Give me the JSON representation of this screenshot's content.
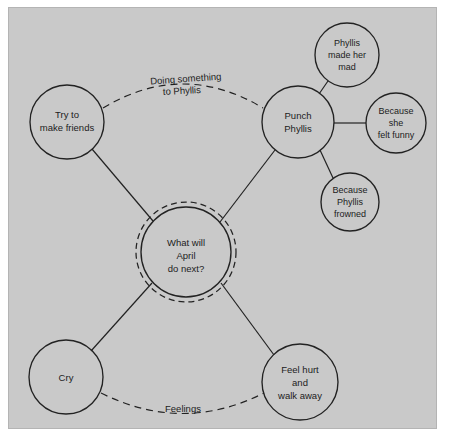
{
  "diagram": {
    "background_color": "#c9c9c9",
    "frame_color": "#b4b4b4",
    "stroke_color": "#222222",
    "text_color": "#1c1c1c",
    "central_node": {
      "id": "center",
      "lines": [
        "What will",
        "April",
        "do next?"
      ],
      "line1": "What will",
      "line2": "April",
      "line3": "do next?",
      "cx": 186,
      "cy": 252,
      "r": 45,
      "ring_r": 50,
      "has_focus_ring": true
    },
    "nodes": [
      {
        "id": "try-to-make-friends",
        "line1": "Try to",
        "line2": "make friends",
        "cx": 67,
        "cy": 122,
        "r": 37
      },
      {
        "id": "punch-phyllis",
        "line1": "Punch",
        "line2": "Phyllis",
        "cx": 298,
        "cy": 122,
        "r": 36
      },
      {
        "id": "phyllis-made-her-mad",
        "line1": "Phyllis",
        "line2": "made her",
        "line3": "mad",
        "cx": 347,
        "cy": 55,
        "r": 32
      },
      {
        "id": "because-she-felt-funny",
        "line1": "Because",
        "line2": "she",
        "line3": "felt funny",
        "cx": 396,
        "cy": 123,
        "r": 30
      },
      {
        "id": "because-phyllis-frowned",
        "line1": "Because",
        "line2": "Phyllis",
        "line3": "frowned",
        "cx": 350,
        "cy": 202,
        "r": 29
      },
      {
        "id": "cry",
        "line1": "Cry",
        "cx": 66,
        "cy": 377,
        "r": 37
      },
      {
        "id": "feel-hurt-and-walk-away",
        "line1": "Feel hurt",
        "line2": "and",
        "line3": "walk away",
        "cx": 300,
        "cy": 382,
        "r": 38
      }
    ],
    "edge_labels": {
      "doing_something_line1": "Doing something",
      "doing_something_line2": "to Phyllis",
      "feelings": "Feelings"
    }
  }
}
